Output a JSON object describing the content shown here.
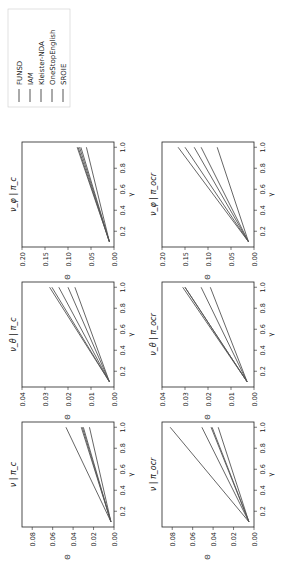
{
  "chart_data": [
    {
      "type": "line",
      "title": "ν | π_c",
      "xlabel": "γ",
      "ylabel": "Θ",
      "ylim": [
        0,
        0.09
      ],
      "yticks": [
        0.0,
        0.02,
        0.04,
        0.06,
        0.08
      ],
      "x": [
        0.1,
        1.0
      ],
      "xticks": [
        0.2,
        0.4,
        0.6,
        0.8,
        1.0
      ],
      "series": [
        {
          "name": "FUNSD",
          "values": [
            0.003,
            0.047
          ]
        },
        {
          "name": "IAM",
          "values": [
            0.003,
            0.032
          ]
        },
        {
          "name": "Kleister-NDA",
          "values": [
            0.003,
            0.031
          ]
        },
        {
          "name": "OneStopEnglish",
          "values": [
            0.003,
            0.03
          ]
        },
        {
          "name": "SROIE",
          "values": [
            0.003,
            0.024
          ]
        }
      ]
    },
    {
      "type": "line",
      "title": "ν_θ | π_c",
      "xlabel": "γ",
      "ylabel": "Θ",
      "ylim": [
        0,
        0.04
      ],
      "yticks": [
        0.0,
        0.01,
        0.02,
        0.03,
        0.04
      ],
      "x": [
        0.1,
        1.0
      ],
      "xticks": [
        0.2,
        0.4,
        0.6,
        0.8,
        1.0
      ],
      "series": [
        {
          "name": "FUNSD",
          "values": [
            0.002,
            0.028
          ]
        },
        {
          "name": "IAM",
          "values": [
            0.002,
            0.027
          ]
        },
        {
          "name": "Kleister-NDA",
          "values": [
            0.002,
            0.024
          ]
        },
        {
          "name": "OneStopEnglish",
          "values": [
            0.002,
            0.02
          ]
        },
        {
          "name": "SROIE",
          "values": [
            0.002,
            0.017
          ]
        }
      ]
    },
    {
      "type": "line",
      "title": "ν_φ | π_c",
      "xlabel": "γ",
      "ylabel": "Θ",
      "ylim": [
        0,
        0.2
      ],
      "yticks": [
        0.0,
        0.05,
        0.1,
        0.15,
        0.2
      ],
      "x": [
        0.1,
        1.0
      ],
      "xticks": [
        0.2,
        0.4,
        0.6,
        0.8,
        1.0
      ],
      "series": [
        {
          "name": "FUNSD",
          "values": [
            0.01,
            0.08
          ]
        },
        {
          "name": "IAM",
          "values": [
            0.01,
            0.078
          ]
        },
        {
          "name": "Kleister-NDA",
          "values": [
            0.01,
            0.075
          ]
        },
        {
          "name": "OneStopEnglish",
          "values": [
            0.01,
            0.072
          ]
        },
        {
          "name": "SROIE",
          "values": [
            0.01,
            0.06
          ]
        }
      ]
    },
    {
      "type": "line",
      "title": "ν | π_ocr",
      "xlabel": "γ",
      "ylabel": "Θ",
      "ylim": [
        0,
        0.09
      ],
      "yticks": [
        0.0,
        0.02,
        0.04,
        0.06,
        0.08
      ],
      "x": [
        0.1,
        1.0
      ],
      "xticks": [
        0.2,
        0.4,
        0.6,
        0.8,
        1.0
      ],
      "series": [
        {
          "name": "FUNSD",
          "values": [
            0.005,
            0.082
          ]
        },
        {
          "name": "IAM",
          "values": [
            0.005,
            0.051
          ]
        },
        {
          "name": "Kleister-NDA",
          "values": [
            0.005,
            0.042
          ]
        },
        {
          "name": "OneStopEnglish",
          "values": [
            0.005,
            0.041
          ]
        },
        {
          "name": "SROIE",
          "values": [
            0.005,
            0.035
          ]
        }
      ]
    },
    {
      "type": "line",
      "title": "ν_θ | π_ocr",
      "xlabel": "γ",
      "ylabel": "Θ",
      "ylim": [
        0,
        0.04
      ],
      "yticks": [
        0.0,
        0.01,
        0.02,
        0.03,
        0.04
      ],
      "x": [
        0.1,
        1.0
      ],
      "xticks": [
        0.2,
        0.4,
        0.6,
        0.8,
        1.0
      ],
      "series": [
        {
          "name": "FUNSD",
          "values": [
            0.003,
            0.031
          ]
        },
        {
          "name": "IAM",
          "values": [
            0.003,
            0.03
          ]
        },
        {
          "name": "Kleister-NDA",
          "values": [
            0.003,
            0.03
          ]
        },
        {
          "name": "OneStopEnglish",
          "values": [
            0.003,
            0.023
          ]
        },
        {
          "name": "SROIE",
          "values": [
            0.003,
            0.019
          ]
        }
      ]
    },
    {
      "type": "line",
      "title": "ν_φ | π_ocr",
      "xlabel": "γ",
      "ylabel": "Θ",
      "ylim": [
        0,
        0.2
      ],
      "yticks": [
        0.0,
        0.05,
        0.1,
        0.15,
        0.2
      ],
      "x": [
        0.1,
        1.0
      ],
      "xticks": [
        0.2,
        0.4,
        0.6,
        0.8,
        1.0
      ],
      "series": [
        {
          "name": "FUNSD",
          "values": [
            0.012,
            0.165
          ]
        },
        {
          "name": "IAM",
          "values": [
            0.012,
            0.15
          ]
        },
        {
          "name": "Kleister-NDA",
          "values": [
            0.012,
            0.13
          ]
        },
        {
          "name": "OneStopEnglish",
          "values": [
            0.012,
            0.115
          ]
        },
        {
          "name": "SROIE",
          "values": [
            0.012,
            0.08
          ]
        }
      ]
    }
  ],
  "legend": {
    "placement": "top-right",
    "entries": [
      "FUNSD",
      "IAM",
      "Kleister-NDA",
      "OneStopEnglish",
      "SROIE"
    ]
  },
  "colors": {
    "line": "#555555",
    "axis": "#222222"
  }
}
